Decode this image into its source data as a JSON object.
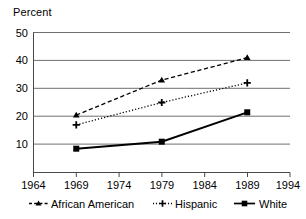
{
  "chart_data": {
    "type": "line",
    "title": "",
    "subtitle": "",
    "xlabel": "",
    "ylabel": "Percent",
    "x": [
      1969,
      1979,
      1989
    ],
    "xlim": [
      1964,
      1994
    ],
    "ylim": [
      0,
      50
    ],
    "xticks": [
      "1964",
      "1969",
      "1974",
      "1979",
      "1984",
      "1989",
      "1994"
    ],
    "yticks": [
      "10",
      "20",
      "30",
      "40",
      "50"
    ],
    "grid": "horizontal",
    "legend_position": "bottom",
    "series": [
      {
        "name": "African American",
        "values": [
          20.5,
          33,
          41
        ],
        "marker": "triangle",
        "line_style": "dashed",
        "color": "#000000"
      },
      {
        "name": "Hispanic",
        "values": [
          17,
          25,
          32
        ],
        "marker": "plus",
        "line_style": "dotted",
        "color": "#000000"
      },
      {
        "name": "White",
        "values": [
          8.5,
          11,
          21.5
        ],
        "marker": "square",
        "line_style": "solid",
        "color": "#000000"
      }
    ]
  },
  "axes": {
    "y_axis_label": "Percent",
    "y_tick_labels": [
      "50",
      "40",
      "30",
      "20",
      "10"
    ],
    "x_tick_labels": [
      "1964",
      "1969",
      "1974",
      "1979",
      "1984",
      "1989",
      "1994"
    ]
  },
  "legend": {
    "entries": [
      {
        "label": "African American",
        "marker": "triangle-marker",
        "style": "dashed"
      },
      {
        "label": "Hispanic",
        "marker": "plus-marker",
        "style": "dotted"
      },
      {
        "label": "White",
        "marker": "square-marker",
        "style": "solid"
      }
    ]
  },
  "colors": {
    "line": "#000000",
    "grid": "#6f6f6f",
    "axis": "#5a5a5a",
    "background": "#ffffff"
  }
}
